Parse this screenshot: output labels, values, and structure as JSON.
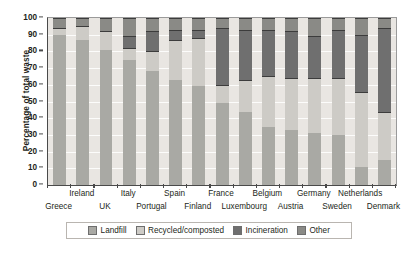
{
  "chart_data": {
    "type": "bar",
    "subtype": "stacked-bar-100",
    "title": "",
    "xlabel": "",
    "ylabel": "Percentage of total waste",
    "ylim": [
      0,
      100
    ],
    "ytick_step": 10,
    "yticks": [
      0,
      10,
      20,
      30,
      40,
      50,
      60,
      70,
      80,
      90,
      100
    ],
    "grid": true,
    "legend_position": "bottom",
    "categories": [
      "Greece",
      "Ireland",
      "UK",
      "Italy",
      "Portugal",
      "Spain",
      "Finland",
      "France",
      "Luxembourg",
      "Belgium",
      "Austria",
      "Germany",
      "Sweden",
      "Netherlands",
      "Denmark"
    ],
    "series": [
      {
        "name": "Landfill",
        "color": "#a9a9a4",
        "values": [
          90,
          87,
          81,
          75,
          68,
          63,
          59,
          49,
          44,
          35,
          33,
          31,
          30,
          11,
          15
        ]
      },
      {
        "name": "Recycled/composted",
        "color": "#cdcbc6",
        "values": [
          4,
          8,
          11,
          7,
          12,
          24,
          29,
          11,
          19,
          30,
          31,
          33,
          34,
          45,
          29
        ]
      },
      {
        "name": "Incineration",
        "color": "#6f6f6f",
        "values": [
          0,
          0,
          0,
          7,
          12,
          6,
          5,
          34,
          30,
          28,
          28,
          25,
          29,
          34,
          50
        ]
      },
      {
        "name": "Other",
        "color": "#8a8a86",
        "values": [
          6,
          5,
          8,
          11,
          8,
          7,
          7,
          6,
          7,
          7,
          8,
          11,
          7,
          10,
          6
        ]
      }
    ]
  },
  "legend": {
    "items": [
      {
        "label": "Landfill",
        "color": "#a9a9a4"
      },
      {
        "label": "Recycled/composted",
        "color": "#cdcbc6"
      },
      {
        "label": "Incineration",
        "color": "#6f6f6f"
      },
      {
        "label": "Other",
        "color": "#8a8a86"
      }
    ]
  },
  "axis": {
    "y_title": "Percentage of total waste"
  },
  "colors": {
    "plot_background": "#e9e6e2",
    "gridline": "#ffffff",
    "axis_line": "#4a4a4a",
    "text": "#231f20"
  }
}
